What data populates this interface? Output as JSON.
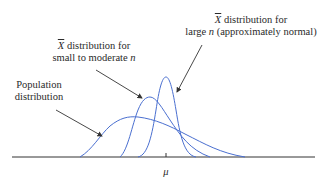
{
  "diagram": {
    "labels": {
      "large_n": {
        "symbol": "X",
        "line1_rest": " distribution for",
        "line2_pre": "large ",
        "line2_var": "n",
        "line2_post": " (approximately normal)"
      },
      "moderate_n": {
        "symbol": "X",
        "line1_rest": " distribution for",
        "line2_pre": "small to moderate ",
        "line2_var": "n"
      },
      "population": {
        "line1": "Population",
        "line2": "distribution"
      },
      "axis_mean": "μ"
    },
    "colors": {
      "curve": "#4a6fd0",
      "axis": "#333333",
      "arrow": "#333333"
    }
  }
}
